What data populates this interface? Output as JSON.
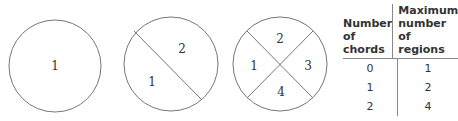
{
  "diagrams": [
    {
      "chords": 0,
      "regions": [
        "1"
      ]
    },
    {
      "chords": 1,
      "regions": [
        "1",
        "2"
      ]
    },
    {
      "chords": 2,
      "regions": [
        "1",
        "2",
        "3",
        "4"
      ]
    }
  ],
  "table": {
    "headers": [
      "Number of chords",
      "Maximum number of regions"
    ],
    "rows": [
      {
        "chords": "0",
        "regions": "1"
      },
      {
        "chords": "1",
        "regions": "2"
      },
      {
        "chords": "2",
        "regions": "4"
      }
    ]
  }
}
